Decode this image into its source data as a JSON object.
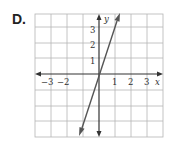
{
  "problem_label": "D.",
  "graph": {
    "x_axis_label": "x",
    "y_axis_label": "y",
    "x_tick_labels": [
      "−3",
      "−2",
      "1",
      "2",
      "3"
    ],
    "y_tick_labels": [
      "1",
      "2",
      "3"
    ],
    "x_range": [
      -4,
      4
    ],
    "y_range": [
      -4,
      4
    ],
    "line": {
      "equation": "y = 3x",
      "slope": 3,
      "intercept": 0,
      "color": "#555555"
    },
    "grid_color": "#b0b0b0",
    "axis_color": "#333333"
  }
}
